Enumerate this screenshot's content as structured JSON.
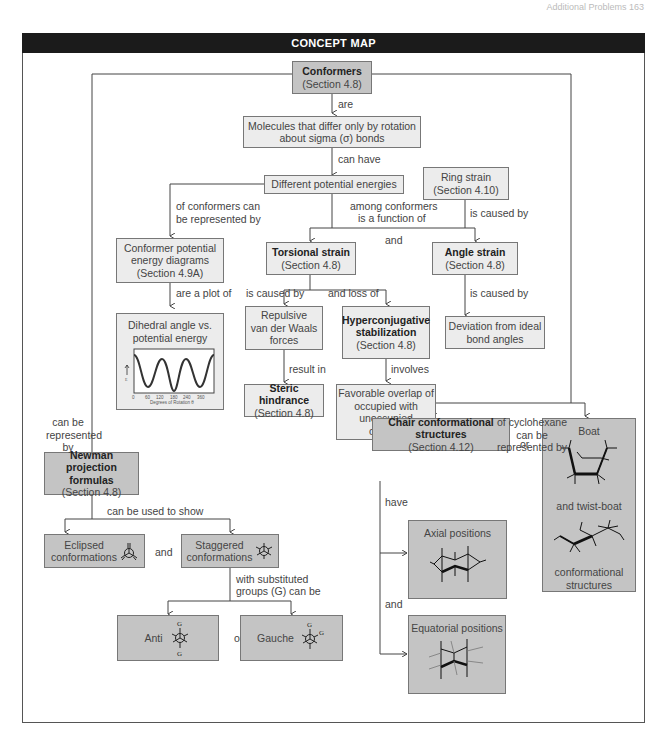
{
  "header": {
    "title": "CONCEPT MAP",
    "running_head": "Additional Problems    163"
  },
  "nodes": {
    "conformers": {
      "title": "Conformers",
      "section": "(Section 4.8)"
    },
    "molecules": {
      "line1": "Molecules that differ only by rotation",
      "line2": "about sigma (σ) bonds"
    },
    "energies": {
      "text": "Different potential energies"
    },
    "ring_strain": {
      "line1": "Ring strain",
      "line2": "(Section 4.10)"
    },
    "cped": {
      "line1": "Conformer potential",
      "line2": "energy diagrams",
      "line3": "(Section 4.9A)"
    },
    "torsional": {
      "title": "Torsional strain",
      "section": "(Section 4.8)"
    },
    "angle": {
      "title": "Angle strain",
      "section": "(Section 4.8)"
    },
    "dihedral": {
      "line1": "Dihedral angle vs.",
      "line2": "potential energy",
      "plot": {
        "x_ticks": [
          "0",
          "60",
          "120",
          "180",
          "240",
          "360"
        ],
        "xlabel": "Degrees of Rotation θ",
        "ylabel": "E"
      }
    },
    "vdw": {
      "line1": "Repulsive",
      "line2": "van der Waals",
      "line3": "forces"
    },
    "hyper": {
      "line1": "Hyperconjugative",
      "line2": "stabilization",
      "section": "(Section 4.8)"
    },
    "deviation": {
      "line1": "Deviation from ideal",
      "line2": "bond angles"
    },
    "steric": {
      "title": "Steric hindrance",
      "section": "(Section 4.8)"
    },
    "overlap": {
      "line1": "Favorable overlap of",
      "line2": "occupied with",
      "line3": "unoccupied",
      "line4": "orbitals"
    },
    "newman": {
      "line1": "Newman projection",
      "line2": "formulas",
      "section": "(Section 4.8)"
    },
    "eclipsed": {
      "line1": "Eclipsed",
      "line2": "conformations"
    },
    "staggered": {
      "line1": "Staggered",
      "line2": "conformations"
    },
    "anti": {
      "text": "Anti",
      "group": "G"
    },
    "gauche": {
      "text": "Gauche",
      "group": "G"
    },
    "chair": {
      "title": "Chair conformational structures",
      "section": "(Section 4.12)"
    },
    "axial": {
      "text": "Axial positions"
    },
    "equatorial": {
      "text": "Equatorial positions"
    },
    "boat": {
      "line1": "Boat",
      "line2": "and twist-boat",
      "line3": "conformational",
      "line4": "structures"
    }
  },
  "links": {
    "are": "are",
    "can_have": "can have",
    "of_conformers_1": "of conformers can",
    "of_conformers_2": "be represented by",
    "among_1": "among conformers",
    "among_2": "is a function of",
    "and_1": "and",
    "ring_caused": "is caused by",
    "are_plot": "are a plot of",
    "tors_caused": "is caused by",
    "and_loss": "and loss of",
    "angle_caused": "is caused by",
    "result_in": "result in",
    "involves": "involves",
    "can_be_rep_1": "can be",
    "can_be_rep_2": "represented",
    "can_be_rep_3": "by",
    "cyclo_1": "of cyclohexane",
    "cyclo_2": "can be",
    "cyclo_3": "represented by",
    "used_to_show": "can be used to show",
    "and_2": "and",
    "subst_1": "with substituted",
    "subst_2": "groups (G) can be",
    "or_1": "or",
    "or_2": "or",
    "have": "have",
    "and_3": "and"
  }
}
